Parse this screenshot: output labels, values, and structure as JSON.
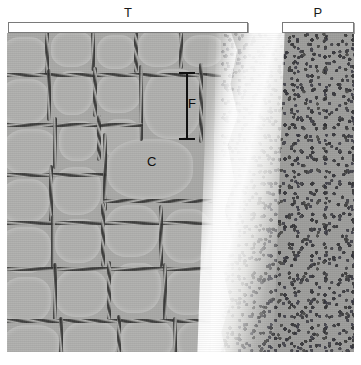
{
  "figure": {
    "type": "histology-micrograph",
    "brackets": [
      {
        "id": "T",
        "label": "T",
        "meaning": "thyroid",
        "region": "left"
      },
      {
        "id": "P",
        "label": "P",
        "meaning": "parathyroid",
        "region": "right"
      }
    ],
    "annotations": [
      {
        "id": "F",
        "label": "F",
        "meaning": "follicle",
        "marker": "double-ended-measurement-bar"
      },
      {
        "id": "C",
        "label": "C",
        "meaning": "colloid",
        "marker": "text-pointer"
      }
    ]
  },
  "colors": {
    "thyroid_tissue": "#a9a9a7",
    "follicle_colloid": "#b0b0ae",
    "parathyroid_tissue": "#9e9e9c",
    "capsule": "#ffffff",
    "nuclei": "#2b2b2b",
    "annotation": "#0d0d0d",
    "bracket_border": "#7a7a7a",
    "background": "#ffffff"
  }
}
